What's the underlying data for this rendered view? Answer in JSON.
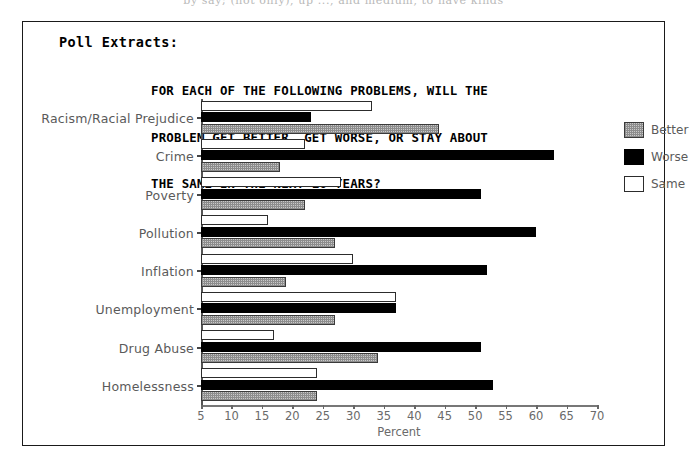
{
  "cropped_top_line": "by say; (not only), up ..., and medium, to have kinds",
  "figure": {
    "poll_label": "Poll Extracts:",
    "title_lines": [
      "FOR EACH OF THE FOLLOWING PROBLEMS, WILL THE",
      "PROBLEM GET BETTER, GET WORSE, OR STAY ABOUT",
      "THE SAME IN THE NEXT 10 YEARS?"
    ]
  },
  "legend": {
    "items": [
      {
        "label": "Better",
        "swatch": "hatched-gray",
        "color": "#c9c9c9"
      },
      {
        "label": "Worse",
        "swatch": "solid-black",
        "color": "#000000"
      },
      {
        "label": "Same",
        "swatch": "outline-white",
        "color": "#ffffff"
      }
    ]
  },
  "chart_data": {
    "type": "bar",
    "orientation": "horizontal",
    "title": "FOR EACH OF THE FOLLOWING PROBLEMS, WILL THE PROBLEM GET BETTER, GET WORSE, OR STAY ABOUT THE SAME IN THE NEXT 10 YEARS?",
    "xlabel": "Percent",
    "ylabel": "",
    "xlim": [
      5,
      70
    ],
    "xticks": [
      5,
      10,
      15,
      20,
      25,
      30,
      35,
      40,
      45,
      50,
      55,
      60,
      65,
      70
    ],
    "grid": false,
    "legend_position": "right",
    "categories": [
      "Racism/Racial Prejudice",
      "Crime",
      "Poverty",
      "Pollution",
      "Inflation",
      "Unemployment",
      "Drug Abuse",
      "Homelessness"
    ],
    "series": [
      {
        "name": "Same",
        "values": [
          33,
          22,
          28,
          16,
          30,
          37,
          17,
          24
        ]
      },
      {
        "name": "Worse",
        "values": [
          23,
          63,
          51,
          60,
          52,
          37,
          51,
          53
        ]
      },
      {
        "name": "Better",
        "values": [
          44,
          18,
          22,
          27,
          19,
          27,
          34,
          24
        ]
      }
    ]
  }
}
